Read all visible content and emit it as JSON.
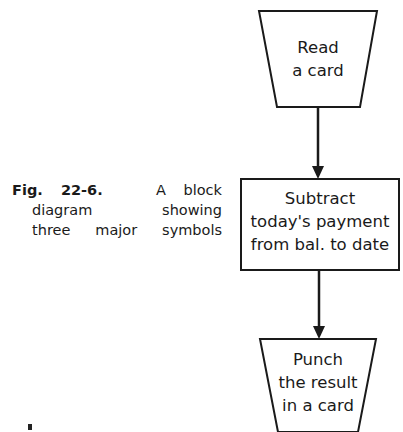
{
  "caption": {
    "figure_label": "Fig. 22-6.",
    "line1_rest": "A block",
    "line2": "diagram showing",
    "line3": "three major symbols"
  },
  "nodes": [
    {
      "id": "read",
      "shape": "trapezoid-input",
      "lines": [
        "Read",
        "a card"
      ]
    },
    {
      "id": "process",
      "shape": "rectangle",
      "lines": [
        "Subtract",
        "today's payment",
        "from bal. to date"
      ]
    },
    {
      "id": "output",
      "shape": "trapezoid-output",
      "lines": [
        "Punch",
        "the result",
        "in a card"
      ]
    }
  ],
  "edges": [
    {
      "from": "read",
      "to": "process"
    },
    {
      "from": "process",
      "to": "output"
    }
  ],
  "colors": {
    "stroke": "#1a1a1a",
    "background": "#ffffff"
  }
}
